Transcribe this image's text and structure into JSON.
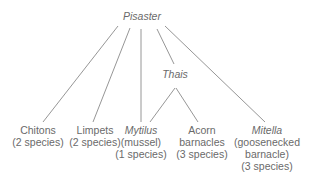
{
  "diagram": {
    "type": "food-web",
    "root": {
      "label": "Pisaster",
      "italic": true
    },
    "intermediate": {
      "label": "Thais",
      "italic": true
    },
    "prey": [
      {
        "name": "Chitons",
        "italic": false,
        "lines": [
          "(2 species)"
        ]
      },
      {
        "name": "Limpets",
        "italic": false,
        "lines": [
          "(2 species)"
        ]
      },
      {
        "name": "Mytilus",
        "italic": true,
        "lines": [
          "(mussel)",
          "(1 species)"
        ]
      },
      {
        "name": "Acorn",
        "italic": false,
        "lines": [
          "barnacles",
          "(3 species)"
        ]
      },
      {
        "name": "Mitella",
        "italic": true,
        "lines": [
          "(goosenecked",
          "barnacle)",
          "(3 species)"
        ]
      }
    ],
    "edges": [
      [
        "Pisaster",
        "Chitons"
      ],
      [
        "Pisaster",
        "Limpets"
      ],
      [
        "Pisaster",
        "Mytilus"
      ],
      [
        "Pisaster",
        "Thais"
      ],
      [
        "Pisaster",
        "Mitella"
      ],
      [
        "Thais",
        "Mytilus"
      ],
      [
        "Thais",
        "Acorn barnacles"
      ]
    ],
    "line_color": "#8a8a8a"
  }
}
